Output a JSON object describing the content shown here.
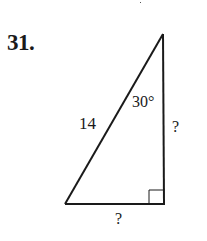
{
  "problem": {
    "number": "31."
  },
  "triangle": {
    "type": "right-triangle",
    "vertices": {
      "top": [
        163,
        34
      ],
      "bottom_left": [
        65,
        204
      ],
      "bottom_right_right_angle": [
        164,
        204
      ]
    },
    "labels": {
      "hypotenuse": "14",
      "angle": "30°",
      "vertical_leg": "?",
      "horizontal_leg": "?"
    },
    "stroke_color": "#1a1a1a"
  }
}
